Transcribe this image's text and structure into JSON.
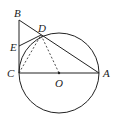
{
  "diagram": {
    "type": "geometry",
    "labels": {
      "B": "B",
      "D": "D",
      "E": "E",
      "C": "C",
      "O": "O",
      "A": "A"
    },
    "points": {
      "B": [
        19,
        20
      ],
      "D": [
        41,
        35
      ],
      "E": [
        19,
        46
      ],
      "C": [
        19,
        73
      ],
      "O": [
        59,
        73
      ],
      "A": [
        99,
        73
      ]
    },
    "circle": {
      "center": "O",
      "radius": 40
    },
    "segments": [
      {
        "from": "B",
        "to": "C",
        "style": "solid"
      },
      {
        "from": "B",
        "to": "A",
        "style": "solid"
      },
      {
        "from": "C",
        "to": "A",
        "style": "solid"
      },
      {
        "from": "E",
        "to": "D",
        "style": "solid"
      },
      {
        "from": "C",
        "to": "D",
        "style": "dashed"
      },
      {
        "from": "O",
        "to": "D",
        "style": "dashed"
      }
    ],
    "colors": {
      "stroke": "#222222",
      "background": "#ffffff"
    }
  }
}
